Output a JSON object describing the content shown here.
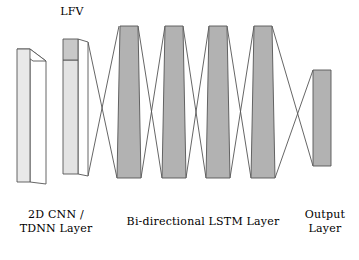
{
  "figure": {
    "kind": "neural-network-architecture-diagram",
    "background_color": "#ffffff",
    "stroke_color": "#4d4d4d"
  },
  "labels": {
    "lfv": "LFV",
    "cnn_line1": "2D CNN /",
    "cnn_line2": "TDNN Layer",
    "lstm": "Bi-directional LSTM Layer",
    "output_line1": "Output",
    "output_line2": "Layer"
  },
  "colors": {
    "cnn_front_face": "#e9e9e9",
    "cnn_top_face": "#d8d8d8",
    "lfv_body": "#e3e3e3",
    "lfv_cap": "#c8c8c8",
    "lstm_block": "#b2b2b2",
    "output_block": "#b2b2b2",
    "outline": "#555555",
    "text": "#000000"
  },
  "blocks": [
    {
      "id": "cnn-block",
      "name": "2D CNN / TDNN Layer",
      "group": "cnn",
      "fill": "#e9e9e9",
      "front": "17,49 30,49 30,182 17,182",
      "top": "17,49 30,49 46,61 33,61",
      "side": "30,49 46,61 46,184 30,182"
    },
    {
      "id": "lfv-block",
      "name": "LFV",
      "group": "lfv",
      "fill": "#e3e3e3",
      "cap_fill": "#c8c8c8",
      "body": "63,60 78,60 78,174 63,174",
      "cap": "63,39 78,39 78,60 63,60",
      "side_top": "78,39 88,48 88,62 78,60",
      "side_body": "78,60 88,62 88,176 78,174"
    },
    {
      "id": "lstm-block-1",
      "name": "Bi-directional LSTM block 1",
      "group": "lstm",
      "fill": "#b2b2b2",
      "points": "120,26 138,26 141,178 117,178"
    },
    {
      "id": "lstm-block-2",
      "name": "Bi-directional LSTM block 2",
      "group": "lstm",
      "fill": "#b2b2b2",
      "points": "165,26 183,26 186,178 162,178"
    },
    {
      "id": "lstm-block-3",
      "name": "Bi-directional LSTM block 3",
      "group": "lstm",
      "fill": "#b2b2b2",
      "points": "209,26 227,26 230,178 206,178"
    },
    {
      "id": "lstm-block-4",
      "name": "Bi-directional LSTM block 4",
      "group": "lstm",
      "fill": "#b2b2b2",
      "points": "254,26 272,26 275,178 251,178"
    },
    {
      "id": "output-block",
      "name": "Output Layer",
      "group": "output",
      "fill": "#b2b2b2",
      "points": "313,70 331,70 331,166 313,166"
    }
  ],
  "connections": [
    {
      "id": "conn-lfv-lstm1-down",
      "from": "lfv-top",
      "to": "lstm1-bottom",
      "x1": 88,
      "y1": 42,
      "x2": 117,
      "y2": 178
    },
    {
      "id": "conn-lfv-lstm1-up",
      "from": "lfv-bottom",
      "to": "lstm1-top",
      "x1": 88,
      "y1": 176,
      "x2": 119,
      "y2": 26
    },
    {
      "id": "conn-lstm1-lstm2-down",
      "from": "lstm1-top",
      "to": "lstm2-bottom",
      "x1": 138,
      "y1": 26,
      "x2": 162,
      "y2": 178
    },
    {
      "id": "conn-lstm1-lstm2-up",
      "from": "lstm1-bottom",
      "to": "lstm2-top",
      "x1": 141,
      "y1": 178,
      "x2": 165,
      "y2": 26
    },
    {
      "id": "conn-lstm2-lstm3-down",
      "from": "lstm2-top",
      "to": "lstm3-bottom",
      "x1": 183,
      "y1": 26,
      "x2": 206,
      "y2": 178
    },
    {
      "id": "conn-lstm2-lstm3-up",
      "from": "lstm2-bottom",
      "to": "lstm3-top",
      "x1": 186,
      "y1": 178,
      "x2": 209,
      "y2": 26
    },
    {
      "id": "conn-lstm3-lstm4-down",
      "from": "lstm3-top",
      "to": "lstm4-bottom",
      "x1": 227,
      "y1": 26,
      "x2": 251,
      "y2": 178
    },
    {
      "id": "conn-lstm3-lstm4-up",
      "from": "lstm3-bottom",
      "to": "lstm4-top",
      "x1": 230,
      "y1": 178,
      "x2": 254,
      "y2": 26
    },
    {
      "id": "conn-lstm4-output-down",
      "from": "lstm4-top",
      "to": "output-bottom",
      "x1": 272,
      "y1": 26,
      "x2": 313,
      "y2": 166
    },
    {
      "id": "conn-lstm4-output-up",
      "from": "lstm4-bottom",
      "to": "output-top",
      "x1": 275,
      "y1": 178,
      "x2": 313,
      "y2": 70
    }
  ]
}
